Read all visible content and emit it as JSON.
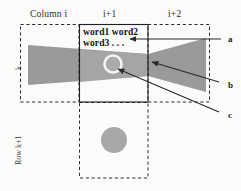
{
  "figure": {
    "type": "diagram",
    "background_color": "#fbfbfa"
  },
  "column_headers": [
    {
      "label": "Column i",
      "x": 30,
      "y": 10
    },
    {
      "label": "i+1",
      "x": 100,
      "y": 10
    },
    {
      "label": "i+2",
      "x": 166,
      "y": 10
    }
  ],
  "row_labels": [
    {
      "label": "k",
      "x": 14,
      "y": 66
    },
    {
      "label": "Row k+1",
      "x": 14,
      "y": 162
    }
  ],
  "cell_text": {
    "line1": "word1 word2",
    "line2": "word3 . . .",
    "x": 82,
    "y": 27
  },
  "annotations": [
    {
      "id": "a",
      "label": "a",
      "x": 228,
      "y": 36
    },
    {
      "id": "b",
      "label": "b",
      "x": 228,
      "y": 86
    },
    {
      "id": "c",
      "label": "c",
      "x": 228,
      "y": 116
    }
  ],
  "colors": {
    "shape_fill": "#999999",
    "shape_fill_light": "#a8a8a8",
    "circle_fill": "#a6a6a6",
    "dashed_stroke": "#2e2e2e",
    "solid_stroke": "#1f1f1f",
    "arrow_stroke": "#2a2a2a",
    "text": "#171717"
  },
  "geometry": {
    "dashed_cells": [
      {
        "name": "cell-column-i-row-k",
        "x": 20,
        "y": 24,
        "w": 59,
        "h": 78
      },
      {
        "name": "cell-column-i2-row-k",
        "x": 148,
        "y": 24,
        "w": 62,
        "h": 78
      },
      {
        "name": "cell-column-i1-row-k1",
        "x": 79,
        "y": 102,
        "w": 69,
        "h": 76
      }
    ],
    "solid_cell": {
      "name": "cell-column-i1-row-k",
      "x": 79,
      "y": 24,
      "w": 69,
      "h": 78
    },
    "bowtie_left": "28,45 148,54 148,76 28,85",
    "bowtie_right": "148,54 206,38 206,92 148,76",
    "highlight_circle": {
      "cx": 113,
      "cy": 64,
      "r": 8.5
    },
    "lower_circle": {
      "cx": 114,
      "cy": 140,
      "r": 13
    },
    "arrow_a": {
      "x1": 221,
      "y1": 39,
      "x2": 128,
      "y2": 39
    },
    "arrow_b": {
      "x1": 219,
      "y1": 82,
      "x2": 150,
      "y2": 61
    },
    "arrow_c": {
      "x1": 219,
      "y1": 112,
      "x2": 116,
      "y2": 68
    }
  }
}
